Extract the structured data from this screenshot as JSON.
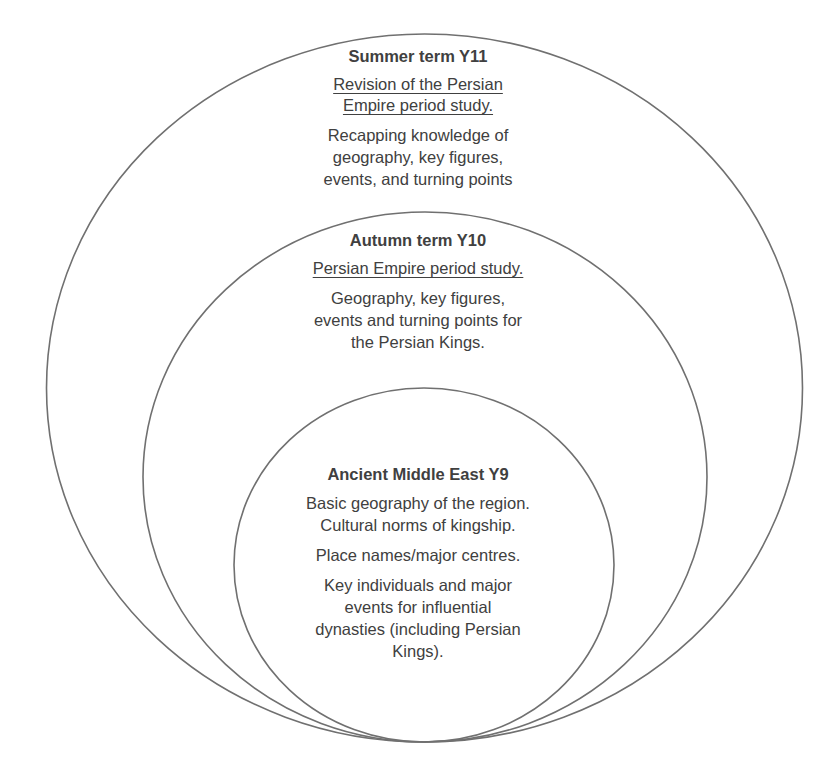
{
  "diagram": {
    "type": "nested-circles",
    "stroke_color": "#707070",
    "text_color": "#404040",
    "rings": [
      {
        "id": "outer",
        "title": "Summer term Y11",
        "subtitle_lines": [
          "Revision of the Persian",
          "Empire period study."
        ],
        "body_lines": [
          "Recapping knowledge of",
          "geography, key figures,",
          "events, and turning points"
        ]
      },
      {
        "id": "middle",
        "title": "Autumn term Y10",
        "subtitle_lines": [
          "Persian Empire period study."
        ],
        "body_lines": [
          "Geography, key figures,",
          "events and turning points for",
          "the Persian Kings."
        ]
      },
      {
        "id": "inner",
        "title": "Ancient Middle East Y9",
        "paragraphs": [
          [
            "Basic geography of the region.",
            "Cultural norms of kingship."
          ],
          [
            "Place names/major centres."
          ],
          [
            "Key individuals and major",
            "events for influential",
            "dynasties (including Persian",
            "Kings)."
          ]
        ]
      }
    ]
  }
}
